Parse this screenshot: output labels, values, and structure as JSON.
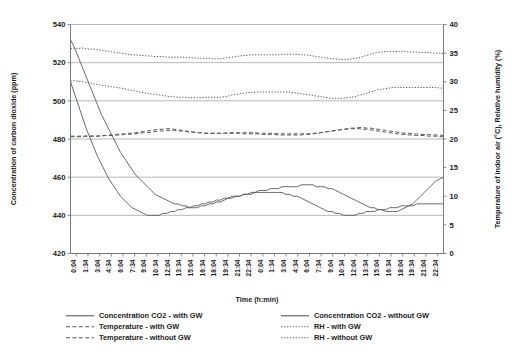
{
  "chart_data": {
    "type": "line",
    "title": "",
    "xlabel": "Time (h:min)",
    "ylabel": "Concentration of carbon dioxide (ppm)",
    "y2label": "Temperature of indoor air (°C), Relative humidity (%)",
    "ylim": [
      420,
      540
    ],
    "yticks": [
      420,
      440,
      460,
      480,
      500,
      520,
      540
    ],
    "y2lim": [
      0,
      40
    ],
    "y2ticks": [
      0,
      5,
      10,
      15,
      20,
      25,
      30,
      35,
      40
    ],
    "grid": true,
    "legend_position": "bottom",
    "xtick_labels": [
      "0:04",
      "1:34",
      "3:04",
      "4:34",
      "6:04",
      "7:34",
      "9:04",
      "10:34",
      "12:04",
      "13:34",
      "15:04",
      "16:34",
      "18:04",
      "19:34",
      "21:04",
      "22:34",
      "0:04",
      "1:34",
      "3:04",
      "4:34",
      "6:04",
      "7:34",
      "9:04",
      "10:34",
      "12:04",
      "13:34",
      "15:04",
      "16:34",
      "18:04",
      "19:34",
      "21:04",
      "22:34"
    ],
    "series": [
      {
        "name": "Concentration CO2 - with GW",
        "axis": "left",
        "style": "solid",
        "color": "#5a5a5a",
        "values": [
          532,
          528,
          523,
          518,
          513,
          508,
          503,
          498,
          493,
          489,
          485,
          481,
          477,
          473,
          470,
          467,
          464,
          461,
          459,
          457,
          455,
          453,
          451,
          450,
          449,
          448,
          447,
          446,
          446,
          445,
          445,
          444,
          444,
          444,
          445,
          445,
          446,
          446,
          447,
          447,
          448,
          449,
          449,
          450,
          450,
          451,
          451,
          452,
          452,
          453,
          453,
          453,
          454,
          454,
          454,
          455,
          455,
          455,
          455,
          455,
          456,
          456,
          456,
          456,
          455,
          455,
          455,
          454,
          454,
          453,
          452,
          451,
          450,
          449,
          448,
          447,
          446,
          445,
          444,
          444,
          443,
          443,
          442,
          442,
          442,
          442,
          443,
          444,
          445,
          446,
          448,
          450,
          452,
          454,
          456,
          458,
          459,
          460
        ]
      },
      {
        "name": "Concentration CO2 - without GW",
        "axis": "left",
        "style": "solid",
        "color": "#5a5a5a",
        "values": [
          510,
          504,
          498,
          492,
          486,
          481,
          476,
          471,
          467,
          463,
          459,
          456,
          453,
          450,
          448,
          446,
          444,
          443,
          442,
          441,
          440,
          440,
          440,
          440,
          441,
          441,
          442,
          442,
          443,
          443,
          444,
          444,
          445,
          445,
          446,
          446,
          447,
          447,
          448,
          448,
          449,
          449,
          450,
          450,
          450,
          451,
          451,
          451,
          452,
          452,
          452,
          452,
          452,
          452,
          452,
          452,
          451,
          451,
          450,
          450,
          449,
          448,
          447,
          446,
          445,
          444,
          443,
          442,
          442,
          441,
          441,
          440,
          440,
          440,
          440,
          441,
          441,
          442,
          442,
          442,
          443,
          443,
          443,
          444,
          444,
          444,
          445,
          445,
          445,
          445,
          446,
          446,
          446,
          446,
          446,
          446,
          446,
          446
        ]
      },
      {
        "name": "Temperature - with GW",
        "axis": "right",
        "style": "dashed",
        "color": "#5a5a5a",
        "values": [
          20.5,
          20.5,
          20.5,
          20.5,
          20.5,
          20.5,
          20.5,
          20.5,
          20.5,
          20.6,
          20.6,
          20.6,
          20.7,
          20.7,
          20.8,
          20.8,
          20.9,
          20.9,
          21.0,
          21.1,
          21.1,
          21.2,
          21.3,
          21.4,
          21.4,
          21.5,
          21.5,
          21.5,
          21.4,
          21.4,
          21.3,
          21.2,
          21.2,
          21.1,
          21.1,
          21.0,
          21.0,
          21.0,
          21.0,
          21.0,
          21.0,
          21.1,
          21.1,
          21.1,
          21.1,
          21.1,
          21.1,
          21.1,
          21.1,
          21.0,
          21.0,
          21.0,
          21.0,
          21.0,
          20.9,
          20.9,
          20.9,
          20.9,
          20.9,
          20.9,
          20.9,
          20.9,
          20.9,
          21.0,
          21.0,
          21.1,
          21.2,
          21.3,
          21.4,
          21.5,
          21.6,
          21.7,
          21.8,
          21.9,
          21.9,
          22.0,
          22.0,
          21.9,
          21.9,
          21.8,
          21.7,
          21.6,
          21.5,
          21.4,
          21.3,
          21.2,
          21.1,
          21.0,
          21.0,
          20.9,
          20.9,
          20.8,
          20.8,
          20.8,
          20.7,
          20.7,
          20.7,
          20.6
        ]
      },
      {
        "name": "Temperature - without GW",
        "axis": "right",
        "style": "dashed",
        "color": "#5a5a5a",
        "values": [
          20.4,
          20.4,
          20.4,
          20.4,
          20.5,
          20.5,
          20.5,
          20.5,
          20.6,
          20.6,
          20.7,
          20.7,
          20.8,
          20.9,
          20.9,
          21.0,
          21.0,
          21.1,
          21.2,
          21.3,
          21.4,
          21.5,
          21.6,
          21.7,
          21.7,
          21.8,
          21.8,
          21.7,
          21.6,
          21.5,
          21.4,
          21.3,
          21.2,
          21.1,
          21.1,
          21.0,
          21.0,
          21.0,
          21.0,
          21.0,
          21.0,
          21.0,
          21.0,
          21.0,
          21.0,
          20.9,
          20.9,
          20.9,
          20.9,
          20.9,
          20.8,
          20.8,
          20.8,
          20.8,
          20.7,
          20.7,
          20.7,
          20.7,
          20.7,
          20.7,
          20.7,
          20.8,
          20.8,
          20.9,
          21.0,
          21.1,
          21.2,
          21.3,
          21.4,
          21.5,
          21.6,
          21.7,
          21.7,
          21.8,
          21.8,
          21.8,
          21.7,
          21.7,
          21.6,
          21.5,
          21.4,
          21.3,
          21.2,
          21.1,
          21.0,
          20.9,
          20.8,
          20.8,
          20.7,
          20.7,
          20.6,
          20.6,
          20.6,
          20.5,
          20.5,
          20.5,
          20.4,
          20.4
        ]
      },
      {
        "name": "RH - with GW",
        "axis": "right",
        "style": "dotted",
        "color": "#5a5a5a",
        "values": [
          35.8,
          35.9,
          35.8,
          35.9,
          35.8,
          35.7,
          35.7,
          35.6,
          35.5,
          35.4,
          35.3,
          35.2,
          35.1,
          35.0,
          34.9,
          34.8,
          34.7,
          34.7,
          34.6,
          34.6,
          34.5,
          34.5,
          34.4,
          34.4,
          34.4,
          34.3,
          34.3,
          34.3,
          34.3,
          34.3,
          34.2,
          34.2,
          34.2,
          34.1,
          34.1,
          34.1,
          34.1,
          34.0,
          34.0,
          34.0,
          34.1,
          34.2,
          34.3,
          34.4,
          34.5,
          34.6,
          34.6,
          34.7,
          34.7,
          34.7,
          34.7,
          34.7,
          34.7,
          34.7,
          34.7,
          34.8,
          34.8,
          34.8,
          34.8,
          34.8,
          34.7,
          34.7,
          34.6,
          34.5,
          34.4,
          34.3,
          34.2,
          34.1,
          34.0,
          34.0,
          33.9,
          33.9,
          33.9,
          34.0,
          34.1,
          34.2,
          34.4,
          34.6,
          34.8,
          35.0,
          35.1,
          35.2,
          35.3,
          35.3,
          35.3,
          35.3,
          35.3,
          35.3,
          35.2,
          35.2,
          35.2,
          35.1,
          35.1,
          35.1,
          35.0,
          35.0,
          35.0,
          34.9
        ]
      },
      {
        "name": "RH - without GW",
        "axis": "right",
        "style": "dotted",
        "color": "#5a5a5a",
        "values": [
          30.1,
          30.2,
          30.1,
          30.0,
          29.9,
          29.8,
          29.6,
          29.5,
          29.4,
          29.3,
          29.2,
          29.1,
          29.0,
          28.9,
          28.8,
          28.6,
          28.5,
          28.4,
          28.2,
          28.1,
          28.0,
          27.9,
          27.8,
          27.7,
          27.6,
          27.5,
          27.4,
          27.4,
          27.3,
          27.3,
          27.3,
          27.2,
          27.2,
          27.2,
          27.2,
          27.3,
          27.3,
          27.3,
          27.3,
          27.3,
          27.4,
          27.5,
          27.7,
          27.8,
          27.9,
          28.0,
          28.1,
          28.1,
          28.2,
          28.2,
          28.2,
          28.2,
          28.2,
          28.2,
          28.2,
          28.2,
          28.2,
          28.2,
          28.1,
          28.0,
          27.9,
          27.8,
          27.7,
          27.6,
          27.5,
          27.4,
          27.3,
          27.2,
          27.1,
          27.1,
          27.1,
          27.1,
          27.2,
          27.3,
          27.4,
          27.6,
          27.8,
          28.0,
          28.2,
          28.4,
          28.6,
          28.7,
          28.8,
          28.9,
          29.0,
          29.0,
          29.0,
          29.0,
          29.0,
          29.0,
          29.0,
          29.0,
          29.0,
          29.0,
          29.0,
          29.0,
          28.9,
          28.9
        ]
      }
    ],
    "legend": [
      {
        "label": "Concentration CO2 - with GW",
        "style": "solid",
        "column": 0
      },
      {
        "label": "Temperature - with GW",
        "style": "dashed",
        "column": 0
      },
      {
        "label": "Temperature - without GW",
        "style": "dashed",
        "column": 0
      },
      {
        "label": "Concentration CO2 - without GW",
        "style": "solid",
        "column": 1
      },
      {
        "label": "RH - with GW",
        "style": "dotted",
        "column": 1
      },
      {
        "label": "RH - without GW",
        "style": "dotted",
        "column": 1
      }
    ]
  }
}
